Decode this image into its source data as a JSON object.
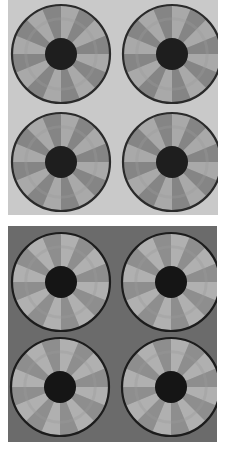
{
  "figure": {
    "panels": [
      {
        "id": "top",
        "background": "#c9c9c9",
        "box": {
          "x": 8,
          "y": 0,
          "w": 210,
          "h": 215
        },
        "wheel_style": {
          "disc_fill": "#9a9a9a",
          "spoke_light": "#a9a9a9",
          "spoke_dark": "#858585",
          "ring_stroke": "#2a2a2a",
          "center_fill": "#1e1e1e"
        },
        "wheels": [
          {
            "cx": 53,
            "cy": 54,
            "r": 49,
            "inner_r": 16,
            "spokes": 16
          },
          {
            "cx": 164,
            "cy": 54,
            "r": 49,
            "inner_r": 16,
            "spokes": 16
          },
          {
            "cx": 53,
            "cy": 162,
            "r": 49,
            "inner_r": 16,
            "spokes": 16
          },
          {
            "cx": 164,
            "cy": 162,
            "r": 49,
            "inner_r": 16,
            "spokes": 16
          }
        ]
      },
      {
        "id": "bottom",
        "background": "#6b6b6b",
        "box": {
          "x": 8,
          "y": 226,
          "w": 209,
          "h": 216
        },
        "wheel_style": {
          "disc_fill": "#9c9c9c",
          "spoke_light": "#b0b0b0",
          "spoke_dark": "#8e8e8e",
          "ring_stroke": "#1c1c1c",
          "center_fill": "#151515"
        },
        "wheels": [
          {
            "cx": 53,
            "cy": 56,
            "r": 49,
            "inner_r": 16,
            "spokes": 16
          },
          {
            "cx": 163,
            "cy": 56,
            "r": 49,
            "inner_r": 16,
            "spokes": 16
          },
          {
            "cx": 52,
            "cy": 161,
            "r": 49,
            "inner_r": 16,
            "spokes": 16
          },
          {
            "cx": 163,
            "cy": 161,
            "r": 49,
            "inner_r": 16,
            "spokes": 16
          }
        ]
      }
    ]
  }
}
